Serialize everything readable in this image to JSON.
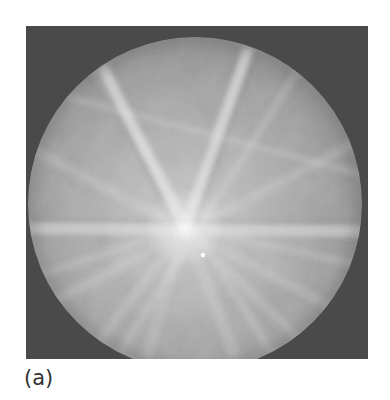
{
  "figure": {
    "panel_label": "(a)",
    "image_type": "kikuchi-diffraction-pattern",
    "colors": {
      "background_dark": "#4a4a4a",
      "phosphor_mid": "#9a9a9a",
      "phosphor_bright": "#dcdcdc",
      "band_highlight": "#ececec"
    },
    "pattern_center": {
      "x": 159,
      "y": 202
    },
    "bright_spot": {
      "x": 177,
      "y": 229
    }
  }
}
